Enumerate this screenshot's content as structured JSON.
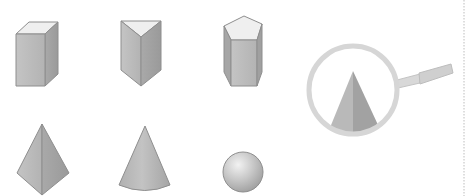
{
  "figure": {
    "shapes": [
      {
        "id": "cuboid",
        "label": "rectangular prism",
        "row": 1,
        "col": 1
      },
      {
        "id": "triangular-prism",
        "label": "triangular prism",
        "row": 1,
        "col": 2
      },
      {
        "id": "pentagonal-prism",
        "label": "pentagonal prism",
        "row": 1,
        "col": 3
      },
      {
        "id": "tetrahedron",
        "label": "triangular pyramid",
        "row": 2,
        "col": 1
      },
      {
        "id": "cone",
        "label": "cone",
        "row": 2,
        "col": 2
      },
      {
        "id": "sphere",
        "label": "sphere",
        "row": 2,
        "col": 3
      }
    ],
    "magnifier": {
      "content": "pyramid side view"
    },
    "colors": {
      "face_light": "#efefef",
      "face_mid": "#b9b9b9",
      "face_dark": "#a3a3a3",
      "edge": "#8e8e8e",
      "lens_ring": "#d6d6d6",
      "divider": "#bdbdbd"
    }
  }
}
